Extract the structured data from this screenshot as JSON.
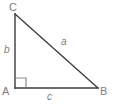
{
  "figure": {
    "kind": "right-triangle-diagram",
    "width": 115,
    "height": 107,
    "background_color": "#ffffff",
    "stroke_color": "#3c3c3c",
    "label_color": "#7d7d7d",
    "stroke_width": 1.4
  },
  "geometry": {
    "vertices": {
      "C": {
        "x": 15,
        "y": 14
      },
      "A": {
        "x": 15,
        "y": 88
      },
      "B": {
        "x": 98,
        "y": 88
      }
    },
    "right_angle": {
      "at_vertex": "A",
      "marker_size": 10
    }
  },
  "labels": {
    "vertices": {
      "c_label": "C",
      "a_label": "A",
      "b_label": "B"
    },
    "sides": {
      "hypotenuse": "a",
      "vertical_leg": "b",
      "horizontal_leg": "c"
    }
  }
}
